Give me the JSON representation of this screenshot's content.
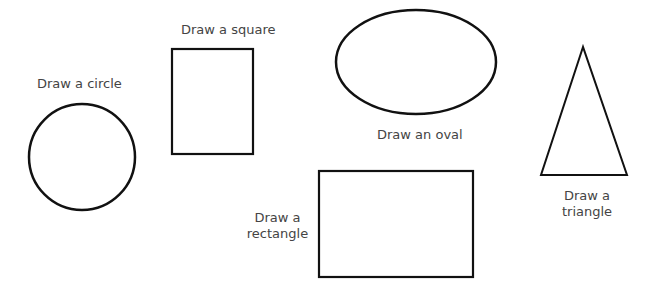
{
  "shapes": [
    {
      "id": "circle",
      "label": "Draw a circle"
    },
    {
      "id": "square",
      "label": "Draw a square"
    },
    {
      "id": "oval",
      "label": "Draw an oval"
    },
    {
      "id": "triangle",
      "label_line1": "Draw a",
      "label_line2": "triangle"
    },
    {
      "id": "rectangle",
      "label_line1": "Draw a",
      "label_line2": "rectangle"
    }
  ],
  "colors": {
    "stroke": "#111111",
    "text": "#444444",
    "background": "#ffffff"
  }
}
